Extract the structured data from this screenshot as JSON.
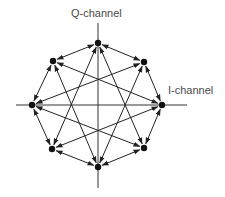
{
  "diagram": {
    "type": "constellation-transition-diagram",
    "axes": {
      "vertical_label": "Q-channel",
      "horizontal_label": "I-channel",
      "origin": [
        98,
        105
      ],
      "vertical_extent": [
        23,
        188
      ],
      "horizontal_extent": [
        16,
        187
      ]
    },
    "colors": {
      "line": "#222222",
      "axis": "#333333",
      "point": "#111111",
      "label": "#4a4a4a"
    },
    "points": [
      {
        "id": "P0",
        "position": "top",
        "x": 98,
        "y": 43
      },
      {
        "id": "P1",
        "position": "upper-right",
        "x": 144,
        "y": 62
      },
      {
        "id": "P2",
        "position": "right",
        "x": 162,
        "y": 105
      },
      {
        "id": "P3",
        "position": "lower-right",
        "x": 144,
        "y": 148
      },
      {
        "id": "P4",
        "position": "bottom",
        "x": 98,
        "y": 167
      },
      {
        "id": "P5",
        "position": "lower-left",
        "x": 52,
        "y": 149
      },
      {
        "id": "P6",
        "position": "left",
        "x": 32,
        "y": 105
      },
      {
        "id": "P7",
        "position": "upper-left",
        "x": 53,
        "y": 61
      }
    ],
    "octagon_edges": [
      [
        0,
        1
      ],
      [
        1,
        2
      ],
      [
        2,
        3
      ],
      [
        3,
        4
      ],
      [
        4,
        5
      ],
      [
        5,
        6
      ],
      [
        6,
        7
      ],
      [
        7,
        0
      ]
    ],
    "star_edges": [
      [
        0,
        3
      ],
      [
        0,
        5
      ],
      [
        1,
        4
      ],
      [
        1,
        6
      ],
      [
        2,
        5
      ],
      [
        2,
        7
      ],
      [
        3,
        6
      ],
      [
        4,
        7
      ]
    ],
    "arrowheads": "both-ends"
  }
}
